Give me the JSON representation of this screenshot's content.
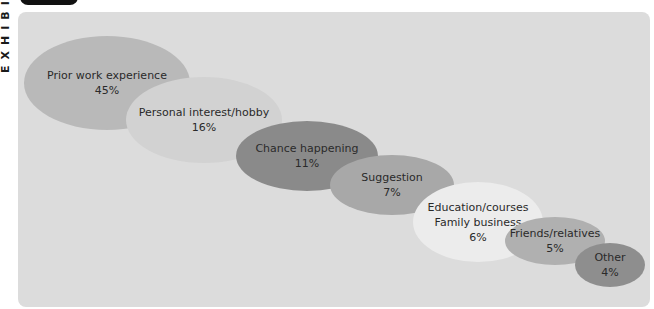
{
  "exhibit": {
    "side_label": "EXHIBIT"
  },
  "chart_data": {
    "type": "bubble",
    "title": "",
    "categories": [
      "Prior work experience",
      "Personal interest/hobby",
      "Chance happening",
      "Suggestion",
      "Education/courses\nFamily business",
      "Friends/relatives",
      "Other"
    ],
    "values": [
      45,
      16,
      11,
      7,
      6,
      5,
      4
    ],
    "unit": "%",
    "bubbles": [
      {
        "label": "Prior work experience",
        "lines": [
          "Prior work experience"
        ],
        "value": 45,
        "pct": "45%",
        "color": "#b9b9b9",
        "cx": 107,
        "cy": 83,
        "rx": 83,
        "ry": 47
      },
      {
        "label": "Personal interest/hobby",
        "lines": [
          "Personal interest/hobby"
        ],
        "value": 16,
        "pct": "16%",
        "color": "#d2d2d2",
        "cx": 204,
        "cy": 120,
        "rx": 78,
        "ry": 43
      },
      {
        "label": "Chance happening",
        "lines": [
          "Chance happening"
        ],
        "value": 11,
        "pct": "11%",
        "color": "#8a8a8a",
        "cx": 307,
        "cy": 156,
        "rx": 71,
        "ry": 35
      },
      {
        "label": "Suggestion",
        "lines": [
          "Suggestion"
        ],
        "value": 7,
        "pct": "7%",
        "color": "#a8a8a8",
        "cx": 392,
        "cy": 185,
        "rx": 62,
        "ry": 30
      },
      {
        "label": "Education/courses Family business",
        "lines": [
          "Education/courses",
          "Family business"
        ],
        "value": 6,
        "pct": "6%",
        "color": "#ececec",
        "cx": 478,
        "cy": 222,
        "rx": 65,
        "ry": 40
      },
      {
        "label": "Friends/relatives",
        "lines": [
          "Friends/relatives"
        ],
        "value": 5,
        "pct": "5%",
        "color": "#b0b0b0",
        "cx": 555,
        "cy": 241,
        "rx": 50,
        "ry": 24
      },
      {
        "label": "Other",
        "lines": [
          "Other"
        ],
        "value": 4,
        "pct": "4%",
        "color": "#8e8e8e",
        "cx": 610,
        "cy": 265,
        "rx": 35,
        "ry": 22
      }
    ],
    "legend": "none",
    "grid": false
  }
}
